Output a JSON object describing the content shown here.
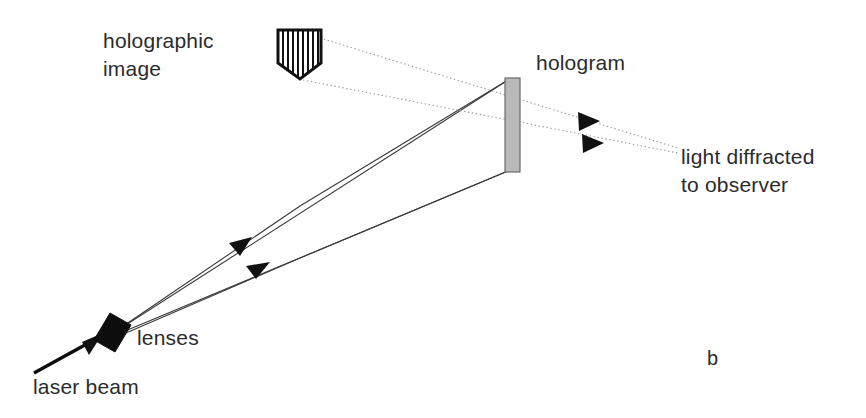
{
  "figure": {
    "panel_letter": "b",
    "background_color": "#ffffff",
    "width": 866,
    "height": 418,
    "title_visible": false
  },
  "labels": {
    "holographic_image": {
      "line1": "holographic",
      "line2": "image",
      "x": 103,
      "y": 48,
      "color": "#2b2b2b"
    },
    "hologram": {
      "text": "hologram",
      "x": 536,
      "y": 70,
      "color": "#2b2b2b"
    },
    "light_diffracted": {
      "line1": "light diffracted",
      "line2": "to observer",
      "x": 681,
      "y": 164,
      "color": "#2b2b2b"
    },
    "lenses": {
      "text": "lenses",
      "x": 137,
      "y": 345,
      "color": "#2b2b2b"
    },
    "laser_beam": {
      "text": "laser beam",
      "x": 33,
      "y": 394,
      "color": "#2b2b2b"
    }
  },
  "objects": {
    "holographic_object": {
      "name": "pentagon-hatched",
      "points": "278,30 321,30 321,63 300,79 278,63",
      "fill": "#ffffff",
      "stroke": "#111111",
      "hatch_count": 9,
      "hatch_color": "#111111"
    },
    "hologram_plate": {
      "name": "hologram-plate",
      "x": 505,
      "y": 78,
      "width": 15,
      "height": 94,
      "fill": "#b9b9b9",
      "stroke": "#6a6a6a"
    },
    "lens_block": {
      "name": "lens-block",
      "points": "95,339 108,315 129,325 116,349",
      "fill": "#0d0d0d"
    },
    "laser_beam_shaft": {
      "x1": 35,
      "y1": 372,
      "x2": 100,
      "y2": 337,
      "color": "#0d0d0d"
    }
  },
  "rays": {
    "solid": [
      {
        "name": "beam-upper-to-plate-top",
        "from_x": 118,
        "from_y": 330,
        "to_x": 508,
        "to_y": 80,
        "style": "solid",
        "color": "#3a3a3a"
      },
      {
        "name": "beam-lower-to-plate-bottom",
        "from_x": 118,
        "from_y": 334,
        "to_x": 508,
        "to_y": 171,
        "style": "solid",
        "color": "#3a3a3a"
      },
      {
        "name": "object-top-edge-ray",
        "from_x": 118,
        "from_y": 330,
        "to_x": 290,
        "to_y": 220,
        "style": "solid",
        "color": "#3a3a3a"
      }
    ],
    "dotted": [
      {
        "name": "diffracted-upper-ray",
        "from_x": 322,
        "from_y": 40,
        "to_x": 680,
        "to_y": 148,
        "style": "dotted",
        "color": "#9a9a9a"
      },
      {
        "name": "diffracted-lower-ray",
        "from_x": 305,
        "from_y": 80,
        "to_x": 680,
        "to_y": 152,
        "style": "dotted",
        "color": "#9a9a9a"
      }
    ],
    "arrow_markers": [
      {
        "name": "arrowhead-beam-upper",
        "x": 243,
        "y": 245,
        "angle": -32,
        "color": "#111111"
      },
      {
        "name": "arrowhead-beam-lower",
        "x": 258,
        "y": 268,
        "angle": -22,
        "color": "#111111"
      },
      {
        "name": "arrowhead-laser",
        "x": 100,
        "y": 337,
        "angle": -28,
        "color": "#0d0d0d"
      },
      {
        "name": "arrowhead-diffracted-upper",
        "x": 589,
        "y": 121,
        "angle": 16,
        "color": "#111111"
      },
      {
        "name": "arrowhead-diffracted-lower",
        "x": 592,
        "y": 142,
        "angle": 11,
        "color": "#111111"
      }
    ]
  }
}
